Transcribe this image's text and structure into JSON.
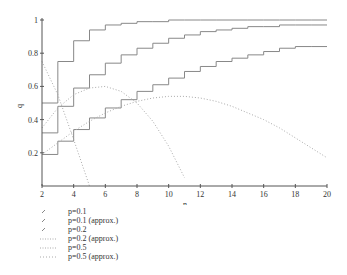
{
  "chart_data": {
    "type": "line",
    "title": "",
    "xlabel": "n",
    "ylabel": "q",
    "xlim": [
      2,
      20
    ],
    "ylim": [
      0,
      1
    ],
    "x_ticks": [
      "2",
      "4",
      "6",
      "8",
      "10",
      "12",
      "14",
      "16",
      "18",
      "20"
    ],
    "y_ticks": [
      "0.2",
      "0.4",
      "0.6",
      "0.8",
      "1"
    ],
    "grid": false,
    "legend_position": "below",
    "x": [
      2,
      3,
      4,
      5,
      6,
      7,
      8,
      9,
      10,
      11,
      12,
      13,
      14,
      15,
      16,
      17,
      18,
      19,
      20
    ],
    "series": [
      {
        "name": "p=0.1",
        "style": "step",
        "values": [
          0.19,
          0.27,
          0.34,
          0.41,
          0.47,
          0.52,
          0.57,
          0.61,
          0.65,
          0.69,
          0.72,
          0.75,
          0.77,
          0.79,
          0.81,
          0.83,
          0.84,
          0.84,
          0.84
        ]
      },
      {
        "name": "p=0.1 (approx.)",
        "style": "dotted",
        "values": [
          0.19,
          0.26,
          0.33,
          0.39,
          0.44,
          0.48,
          0.51,
          0.53,
          0.54,
          0.54,
          0.53,
          0.51,
          0.48,
          0.44,
          0.4,
          0.35,
          0.29,
          0.23,
          0.17
        ]
      },
      {
        "name": "p=0.2",
        "style": "step",
        "values": [
          0.32,
          0.48,
          0.59,
          0.67,
          0.74,
          0.79,
          0.83,
          0.86,
          0.89,
          0.91,
          0.93,
          0.94,
          0.95,
          0.96,
          0.96,
          0.97,
          0.97,
          0.97,
          0.97
        ]
      },
      {
        "name": "p=0.2 (approx.)",
        "style": "dotted",
        "values": [
          0.35,
          0.47,
          0.55,
          0.59,
          0.6,
          0.57,
          0.5,
          0.39,
          0.24,
          0.05,
          null,
          null,
          null,
          null,
          null,
          null,
          null,
          null,
          null
        ]
      },
      {
        "name": "p=0.5",
        "style": "step",
        "values": [
          0.5,
          0.75,
          0.875,
          0.94,
          0.97,
          0.98,
          0.99,
          0.99,
          1.0,
          1.0,
          1.0,
          1.0,
          1.0,
          1.0,
          1.0,
          1.0,
          1.0,
          1.0,
          1.0
        ]
      },
      {
        "name": "p=0.5 (approx.)",
        "style": "dotted",
        "values": [
          0.75,
          0.55,
          0.28,
          0.0,
          null,
          null,
          null,
          null,
          null,
          null,
          null,
          null,
          null,
          null,
          null,
          null,
          null,
          null,
          null
        ]
      }
    ]
  },
  "legend": {
    "items": [
      {
        "label": "p=0.1"
      },
      {
        "label": "p=0.1 (approx.)"
      },
      {
        "label": "p=0.2"
      },
      {
        "label": "p=0.2 (approx.)"
      },
      {
        "label": "p=0.5"
      },
      {
        "label": "p=0.5 (approx.)"
      }
    ]
  },
  "colors": {
    "line": "#888888",
    "axis": "#555555",
    "text": "#333333"
  }
}
